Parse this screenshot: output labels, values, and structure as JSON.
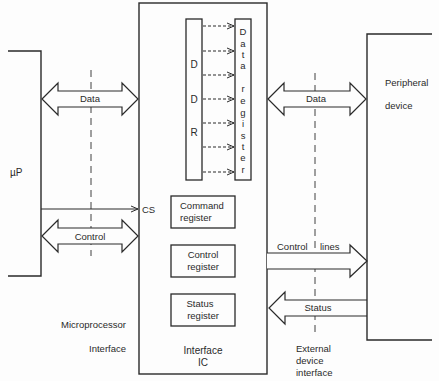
{
  "diagram": {
    "type": "block-diagram",
    "title": "",
    "colors": {
      "stroke": "#2a2a2a",
      "background": "#fdfdfd"
    },
    "blocks": {
      "microprocessor": {
        "label": "µP"
      },
      "interface_ic": {
        "label_line1": "Interface",
        "label_line2": "IC"
      },
      "ddr": {
        "letters": [
          "D",
          "D",
          "R"
        ]
      },
      "data_register": {
        "letters": [
          "D",
          "a",
          "t",
          "a",
          "",
          "r",
          "e",
          "g",
          "i",
          "s",
          "t",
          "e",
          "r"
        ]
      },
      "command_register": {
        "line1": "Command",
        "line2": "register"
      },
      "control_register": {
        "line1": "Control",
        "line2": "register"
      },
      "status_register": {
        "line1": "Status",
        "line2": "register"
      },
      "peripheral": {
        "line1": "Peripheral",
        "line2": "device"
      }
    },
    "connections": {
      "data_left": {
        "label": "Data",
        "direction": "bidirectional"
      },
      "cs": {
        "label": "CS",
        "direction": "right"
      },
      "control_left": {
        "label": "Control",
        "direction": "bidirectional"
      },
      "data_right": {
        "label": "Data",
        "direction": "bidirectional"
      },
      "control_lines": {
        "label_a": "Control",
        "label_b": "lines",
        "direction": "right"
      },
      "status": {
        "label": "Status",
        "direction": "left"
      },
      "ddr_to_data_register_count": 7
    },
    "captions": {
      "microprocessor_interface": {
        "line1": "Microprocessor",
        "line2": "Interface"
      },
      "external_device_interface": {
        "line1": "External",
        "line2": "device",
        "line3": "interface"
      }
    }
  }
}
